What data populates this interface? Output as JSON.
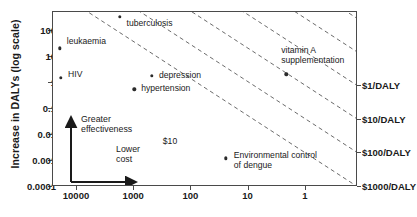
{
  "chart_data": {
    "type": "scatter",
    "title": "",
    "xlabel": "",
    "ylabel": "Increase in DALYs (log scale)",
    "x_scale": "log-reversed",
    "y_scale": "log",
    "xlim": [
      31623,
      0.55
    ],
    "ylim": [
      0.0001,
      400
    ],
    "grid": false,
    "legend": "none",
    "xticks": [
      "10000",
      "1000",
      "100",
      "10",
      "1"
    ],
    "xtick_values": [
      10000,
      1000,
      100,
      10,
      1
    ],
    "yticks": [
      "100",
      "10",
      "1",
      "0.1",
      "0.01",
      "0.001",
      "0.0001"
    ],
    "ytick_values": [
      100,
      10,
      1,
      0.1,
      0.01,
      0.001,
      0.0001
    ],
    "right_axis_labels": [
      "$1/DALY",
      "$10/DALY",
      "$100/DALY",
      "$1000/DALY"
    ],
    "right_axis_values": [
      1,
      10,
      100,
      1000
    ],
    "points": [
      {
        "label": "leukaemia",
        "x": 20000,
        "y": 21,
        "label_dx": 7,
        "label_dy": -6
      },
      {
        "label": "HIV",
        "x": 19000,
        "y": 1.5,
        "label_dx": 7,
        "label_dy": -3
      },
      {
        "label": "tuberculosis",
        "x": 1800,
        "y": 330,
        "label_dx": 7,
        "label_dy": 7
      },
      {
        "label": "depression",
        "x": 490,
        "y": 1.8,
        "label_dx": 7,
        "label_dy": 0
      },
      {
        "label": "hypertension",
        "x": 1000,
        "y": 0.55,
        "label_dx": 7,
        "label_dy": 0
      },
      {
        "label": "vitamin A\nsupplementation",
        "x": 2.2,
        "y": 2.1,
        "label_dx": -5,
        "label_dy": -18
      },
      {
        "label": "Environmental control\nof dengue",
        "x": 25,
        "y": 0.0012,
        "label_dx": 8,
        "label_dy": 3
      }
    ],
    "iso_cost_lines": [
      {
        "label": "",
        "cost_per_daly": 0.01
      },
      {
        "label": "",
        "cost_per_daly": 0.1
      },
      {
        "label": "$10",
        "cost_per_daly": 10
      },
      {
        "label": "",
        "cost_per_daly": 1
      },
      {
        "label": "",
        "cost_per_daly": 100
      },
      {
        "label": "",
        "cost_per_daly": 1000
      }
    ],
    "inline_line_label": "$10",
    "annotations": [
      {
        "text": "Greater\neffectiveness",
        "direction": "up"
      },
      {
        "text": "Lower\ncost",
        "direction": "right"
      }
    ]
  },
  "axis": {
    "y_title": "Increase in DALYs (log scale)"
  },
  "colors": {
    "axis": "#4a4a4a",
    "point": "#2b2b2b",
    "dashed_line": "#5a5a5a",
    "text": "#1a1a1a",
    "background": "#ffffff"
  }
}
